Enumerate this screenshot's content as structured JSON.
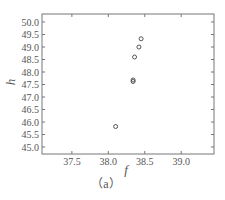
{
  "chart_data": {
    "type": "scatter",
    "title": "",
    "xlabel": "f",
    "ylabel": "h",
    "caption": "（a）",
    "xlim": [
      37.09,
      39.45
    ],
    "ylim": [
      44.72,
      50.32
    ],
    "xticks": [
      37.5,
      38.0,
      39.0,
      38.5
    ],
    "xtick_labels": [
      "37.5",
      "38.0",
      "39.0",
      "38.5"
    ],
    "yticks": [
      45.0,
      45.5,
      46.0,
      46.5,
      47.0,
      47.5,
      48.0,
      48.5,
      49.0,
      49.5,
      50.0
    ],
    "ytick_labels": [
      "45.0",
      "45.5",
      "46.0",
      "46.5",
      "47.0",
      "47.5",
      "48.0",
      "48.5",
      "49.0",
      "49.5",
      "50.0"
    ],
    "grid": false,
    "legend": null,
    "marker": "open-circle",
    "series": [
      {
        "name": "data",
        "points": [
          {
            "x": 38.1,
            "y": 45.82
          },
          {
            "x": 38.34,
            "y": 47.62
          },
          {
            "x": 38.34,
            "y": 47.68
          },
          {
            "x": 38.36,
            "y": 48.6
          },
          {
            "x": 38.42,
            "y": 49.0
          },
          {
            "x": 38.45,
            "y": 49.33
          }
        ]
      }
    ]
  },
  "colors": {
    "axis": "#777777",
    "marker": "#444444",
    "text": "#555555"
  }
}
